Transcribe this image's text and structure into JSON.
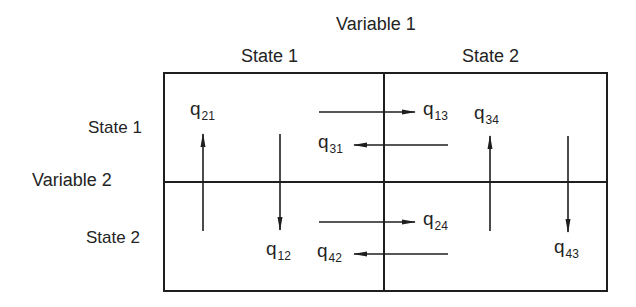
{
  "diagram": {
    "variable1_label": "Variable 1",
    "variable2_label": "Variable 2",
    "columns": [
      {
        "label": "State 1"
      },
      {
        "label": "State 2"
      }
    ],
    "rows": [
      {
        "label": "State 1"
      },
      {
        "label": "State 2"
      }
    ],
    "rates": {
      "q21": {
        "base": "q",
        "sub": "21"
      },
      "q13": {
        "base": "q",
        "sub": "13"
      },
      "q34": {
        "base": "q",
        "sub": "34"
      },
      "q31": {
        "base": "q",
        "sub": "31"
      },
      "q24": {
        "base": "q",
        "sub": "24"
      },
      "q12": {
        "base": "q",
        "sub": "12"
      },
      "q42": {
        "base": "q",
        "sub": "42"
      },
      "q43": {
        "base": "q",
        "sub": "43"
      }
    },
    "colors": {
      "line": "#1e1e1e",
      "text": "#232323",
      "background": "#ffffff"
    }
  }
}
